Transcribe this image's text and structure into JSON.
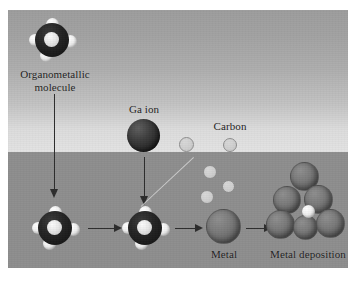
{
  "figure": {
    "type": "schematic-diagram",
    "background": {
      "gas_phase_color": "#aeaeae",
      "substrate_color": "#8e8e8e",
      "panel_border_color": "#ffffff"
    },
    "palette": {
      "dark_sphere": "#262626",
      "metal_sphere": "#6f6f6f",
      "light_sphere": "#f0f0f0",
      "carbon_sphere": "#cfcfcf",
      "arrow": "#2c2c2c",
      "label_text": "#1d1d1d"
    }
  },
  "labels": {
    "organometallic": "Organometallic\nmolecule",
    "ga_ion": "Ga ion",
    "carbon": "Carbon",
    "metal": "Metal",
    "metal_deposition": "Metal deposition"
  },
  "steps": [
    {
      "id": "precursor-gas",
      "label": "Organometallic\nmolecule",
      "phase": "gas"
    },
    {
      "id": "precursor-adsorbed",
      "label": "",
      "phase": "surface"
    },
    {
      "id": "ion-strike",
      "label": "Ga ion",
      "phase": "gas"
    },
    {
      "id": "dissociated",
      "label": "",
      "phase": "surface"
    },
    {
      "id": "metal-atom",
      "label": "Metal",
      "phase": "surface"
    },
    {
      "id": "deposit",
      "label": "Metal deposition",
      "phase": "surface"
    }
  ],
  "species": {
    "ga_ion": {
      "name": "Ga ion",
      "color": "#262626",
      "role": "incident primary ion"
    },
    "carbon": {
      "name": "Carbon",
      "color": "#cfcfcf",
      "role": "released ligand fragment"
    },
    "metal": {
      "name": "Metal",
      "color": "#6f6f6f",
      "role": "deposited metal atom"
    },
    "ligand": {
      "name": "Ligand",
      "color": "#f0f0f0",
      "role": "light ligand sphere"
    }
  },
  "carbon_fragments": {
    "count": 5,
    "note": "released carbon fragments scattered after dissociation"
  },
  "deposit_cluster": {
    "metal_count": 6,
    "carbon_count": 1
  }
}
